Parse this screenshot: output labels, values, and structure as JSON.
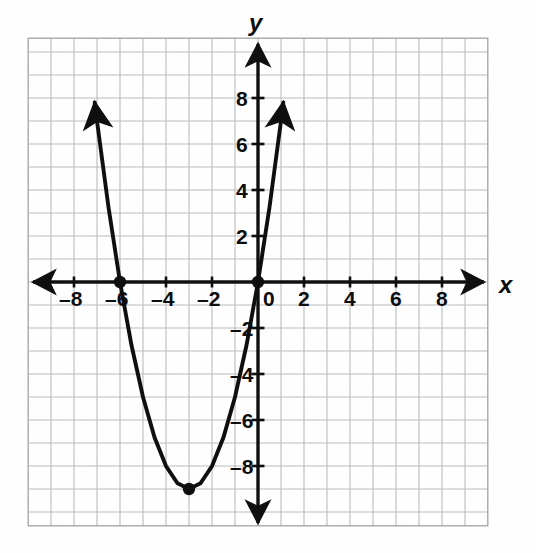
{
  "figure": {
    "kind": "coordinate-plane-graph",
    "background_color": "#ffffff",
    "grid_color": "#b9bcc0",
    "ink_color": "#111111",
    "paper": "graph-paper-photocopy"
  },
  "axes": {
    "x_axis_label": "x",
    "y_axis_label": "y",
    "origin_label": "0",
    "x_ticks": [
      "–8",
      "–6",
      "–4",
      "–2",
      "2",
      "4",
      "6",
      "8"
    ],
    "y_ticks": [
      "8",
      "6",
      "4",
      "2",
      "–2",
      "–4",
      "–6",
      "–8"
    ],
    "x_tick_values": [
      -8,
      -6,
      -4,
      -2,
      2,
      4,
      6,
      8
    ],
    "y_tick_values": [
      8,
      6,
      4,
      2,
      -2,
      -4,
      -6,
      -8
    ],
    "x_arrow_left": true,
    "x_arrow_right": true,
    "y_arrow_up": true,
    "y_arrow_down": true
  },
  "chart_data": {
    "type": "line",
    "title": "",
    "subtitle": "",
    "xlabel": "x",
    "ylabel": "y",
    "xlim": [
      -9.6,
      9.6
    ],
    "ylim": [
      -10.4,
      9.9
    ],
    "xticks": [
      -8,
      -6,
      -4,
      -2,
      0,
      2,
      4,
      6,
      8
    ],
    "yticks": [
      -8,
      -6,
      -4,
      -2,
      0,
      2,
      4,
      6,
      8
    ],
    "grid": true,
    "grid_step": 1,
    "legend": "none",
    "series": [
      {
        "name": "y = x^2 + 6x",
        "equation": "y = x^2 + 6x",
        "type": "parabola",
        "a": 1,
        "b": 6,
        "c": 0,
        "vertex": [
          -3,
          -9
        ],
        "roots": [
          -6,
          0
        ],
        "opens": "up",
        "arrows": [
          "up-left",
          "up-right"
        ],
        "x": [
          -7.1,
          -7.0,
          -6.5,
          -6.0,
          -5.5,
          -5.0,
          -4.5,
          -4.0,
          -3.5,
          -3.0,
          -2.5,
          -2.0,
          -1.5,
          -1.0,
          -0.5,
          0.0,
          0.5,
          1.0,
          1.1
        ],
        "values": [
          7.81,
          7.0,
          3.25,
          0.0,
          -2.75,
          -5.0,
          -6.75,
          -8.0,
          -8.75,
          -9.0,
          -8.75,
          -8.0,
          -6.75,
          -5.0,
          -2.75,
          0.0,
          3.25,
          7.0,
          7.81
        ]
      }
    ],
    "points": [
      {
        "name": "x-intercept",
        "x": -6,
        "y": 0,
        "marker": "filled-circle"
      },
      {
        "name": "origin-intercept",
        "x": 0,
        "y": 0,
        "marker": "filled-circle"
      },
      {
        "name": "vertex",
        "x": -3,
        "y": -9,
        "marker": "filled-circle"
      }
    ]
  }
}
